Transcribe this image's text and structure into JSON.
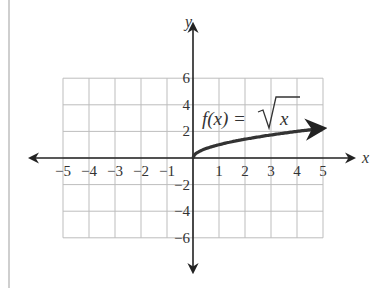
{
  "chart_data": {
    "type": "line",
    "title": "",
    "xlabel": "x",
    "ylabel": "y",
    "xlim": [
      -5,
      5
    ],
    "ylim": [
      -6,
      6
    ],
    "grid": true,
    "x_ticks": [
      -5,
      -4,
      -3,
      -2,
      -1,
      1,
      2,
      3,
      4,
      5
    ],
    "x_tick_labels": [
      "−5",
      "−4",
      "−3",
      "−2",
      "−1",
      "1",
      "2",
      "3",
      "4",
      "5"
    ],
    "y_ticks": [
      6,
      4,
      2,
      -2,
      -4,
      -6
    ],
    "y_tick_labels": [
      "6",
      "4",
      "2",
      "−2",
      "−4",
      "−6"
    ],
    "series": [
      {
        "name": "f(x) = √x",
        "function": "sqrt(x)",
        "x": [
          0,
          0.25,
          0.5,
          1,
          2,
          3,
          4,
          5
        ],
        "values": [
          0,
          0.5,
          0.71,
          1,
          1.41,
          1.73,
          2,
          2.24
        ],
        "color": "#333333",
        "end_arrow": true
      }
    ],
    "annotations": [
      {
        "text": "f(x) = √x",
        "position": "above curve, near x=1..3"
      }
    ],
    "legend": "none"
  },
  "labels": {
    "x_axis": "x",
    "y_axis": "y",
    "function_prefix": "f(x) = ",
    "function_radicand": "x"
  }
}
